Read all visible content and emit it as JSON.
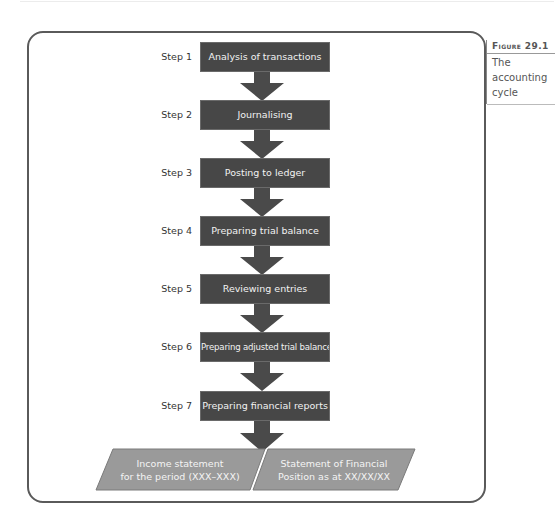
{
  "figure": {
    "label": "Figure 29.1",
    "caption_lines": [
      "The",
      "accounting",
      "cycle"
    ]
  },
  "steps": [
    {
      "label": "Step 1",
      "text": "Analysis of transactions"
    },
    {
      "label": "Step 2",
      "text": "Journalising"
    },
    {
      "label": "Step 3",
      "text": "Posting to ledger"
    },
    {
      "label": "Step 4",
      "text": "Preparing trial balance"
    },
    {
      "label": "Step 5",
      "text": "Reviewing entries"
    },
    {
      "label": "Step 6",
      "text": "Preparing adjusted trial balance"
    },
    {
      "label": "Step 7",
      "text": "Preparing financial reports"
    }
  ],
  "outputs": [
    {
      "line1": "Income statement",
      "line2": "for the period (XXX–XXX)"
    },
    {
      "line1": "Statement of Financial",
      "line2": "Position as at XX/XX/XX"
    }
  ],
  "colors": {
    "step_box": "#474747",
    "arrow": "#4a4a4a",
    "output_box": "#9a9a9a",
    "frame": "#5a5a5a"
  }
}
